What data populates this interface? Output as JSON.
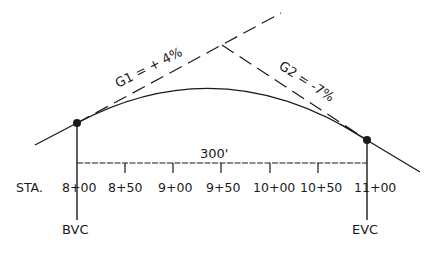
{
  "diagram": {
    "type": "vertical-curve",
    "colors": {
      "ink": "#1a1a1a",
      "background": "#ffffff"
    },
    "grades": {
      "g1": {
        "label": "G1 = + 4%"
      },
      "g2": {
        "label": "G2 = -7%"
      }
    },
    "length_label": "300'",
    "station_prefix": "STA.",
    "stations": [
      "8+00",
      "8+50",
      "9+00",
      "9+50",
      "10+00",
      "10+50",
      "11+00"
    ],
    "points": {
      "bvc": {
        "label": "BVC"
      },
      "evc": {
        "label": "EVC"
      }
    }
  }
}
